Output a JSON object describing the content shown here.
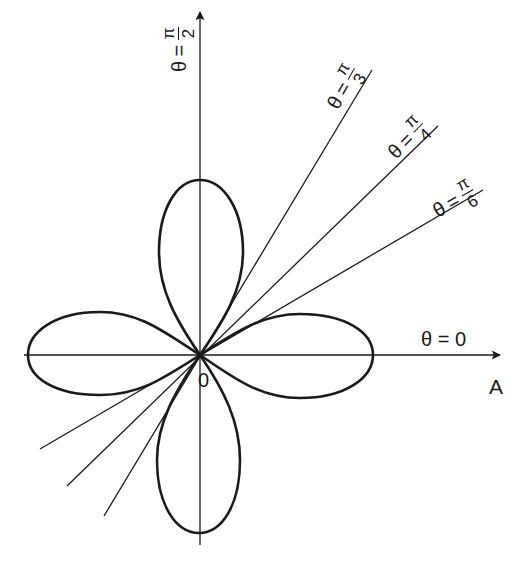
{
  "diagram": {
    "type": "polar-rose-with-angle-lines",
    "origin_label": "0",
    "horizontal_axis": {
      "angle_label": {
        "theta": "θ",
        "equals": "=",
        "value": "0"
      },
      "axis_name": "A"
    },
    "vertical_axis": {
      "angle_label": {
        "theta": "θ",
        "equals": "=",
        "numerator": "π",
        "denominator": "2"
      }
    },
    "rays": [
      {
        "id": "pi-over-3",
        "theta": "θ",
        "equals": "=",
        "numerator": "π",
        "denominator": "3",
        "angle_deg": 60
      },
      {
        "id": "pi-over-4",
        "theta": "θ",
        "equals": "=",
        "numerator": "π",
        "denominator": "4",
        "angle_deg": 45
      },
      {
        "id": "pi-over-6",
        "theta": "θ",
        "equals": "=",
        "numerator": "π",
        "denominator": "6",
        "angle_deg": 30
      }
    ],
    "petals": [
      "top",
      "right",
      "bottom",
      "left"
    ],
    "colors": {
      "stroke": "#1a1a1a",
      "background": "#ffffff"
    }
  }
}
